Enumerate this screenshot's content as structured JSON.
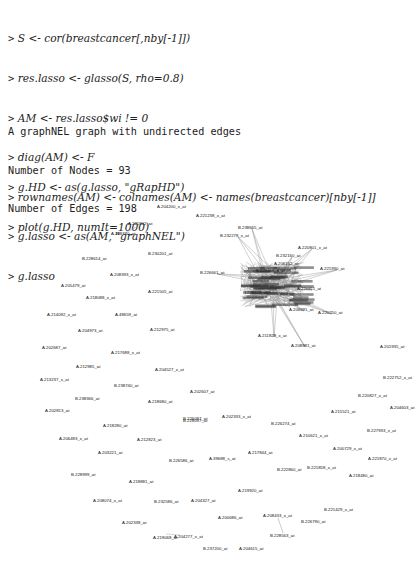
{
  "code": {
    "lines": [
      {
        "prompt": ">",
        "text": "S <- cor(breastcancer[,nby[-1]])"
      },
      {
        "prompt": ">",
        "text": "res.lasso <- glasso(S, rho=0.8)"
      },
      {
        "prompt": ">",
        "text": "AM <- res.lasso$wi != 0"
      },
      {
        "prompt": ">",
        "text": "diag(AM) <- F"
      },
      {
        "prompt": ">",
        "text": "rownames(AM) <- colnames(AM) <- names(breastcancer)[nby[-1]]"
      },
      {
        "prompt": ">",
        "text": "g.lasso <- as(AM, \"graphNEL\")"
      },
      {
        "prompt": ">",
        "text": "g.lasso"
      }
    ]
  },
  "output": {
    "lines": [
      "A graphNEL graph with undirected edges",
      "Number of Nodes = 93",
      "Number of Edges = 198"
    ]
  },
  "code2": {
    "lines": [
      {
        "prompt": ">",
        "text": "g.HD <- as(g.lasso, \"gRapHD\")"
      },
      {
        "prompt": ">",
        "text": "plot(g.HD, numIt=1000)"
      }
    ]
  },
  "plot": {
    "description": "gRapHD network plot of lasso graph",
    "nodes": 93,
    "edges": 198,
    "edge_color": "#9a9a9a",
    "label_color": "#111111",
    "labels": [
      {
        "text": "A.204200_x_at",
        "x": 157,
        "y": 22
      },
      {
        "text": "A.221238_x_at",
        "x": 196,
        "y": 31
      },
      {
        "text": "A.221802_at",
        "x": 128,
        "y": 39
      },
      {
        "text": "A.208340_at",
        "x": 111,
        "y": 49
      },
      {
        "text": "B.238665_at",
        "x": 238,
        "y": 43
      },
      {
        "text": "B.232278_x_at",
        "x": 220,
        "y": 51
      },
      {
        "text": "B.230201_at",
        "x": 148,
        "y": 69
      },
      {
        "text": "B.228614_at",
        "x": 82,
        "y": 74
      },
      {
        "text": "A.208393_x_at",
        "x": 110,
        "y": 90
      },
      {
        "text": "B.226661_at",
        "x": 200,
        "y": 88
      },
      {
        "text": "A.205479_at",
        "x": 61,
        "y": 101
      },
      {
        "text": "A.221505_at",
        "x": 148,
        "y": 107
      },
      {
        "text": "A.218088_x_at",
        "x": 86,
        "y": 113
      },
      {
        "text": "A.220801_x_at",
        "x": 298,
        "y": 63
      },
      {
        "text": "B.232160_at",
        "x": 276,
        "y": 71
      },
      {
        "text": "A.206162_at",
        "x": 274,
        "y": 79
      },
      {
        "text": "B.229858_x_at",
        "x": 256,
        "y": 86
      },
      {
        "text": "A.221930_at",
        "x": 320,
        "y": 84
      },
      {
        "text": "A.220811_at",
        "x": 297,
        "y": 104
      },
      {
        "text": "A.214092_x_at",
        "x": 47,
        "y": 130
      },
      {
        "text": "A.48659_at",
        "x": 115,
        "y": 130
      },
      {
        "text": "B.228510_at",
        "x": 243,
        "y": 108
      },
      {
        "text": "A.220250_at",
        "x": 318,
        "y": 128
      },
      {
        "text": "A.206691_at",
        "x": 289,
        "y": 125
      },
      {
        "text": "A.204973_at",
        "x": 78,
        "y": 146
      },
      {
        "text": "A.212975_at",
        "x": 150,
        "y": 145
      },
      {
        "text": "A.211828_x_at",
        "x": 258,
        "y": 151
      },
      {
        "text": "A.202687_at",
        "x": 42,
        "y": 163
      },
      {
        "text": "A.217688_x_at",
        "x": 111,
        "y": 168
      },
      {
        "text": "A.208981_at",
        "x": 291,
        "y": 161
      },
      {
        "text": "A.201935_at",
        "x": 380,
        "y": 162
      },
      {
        "text": "A.212985_at",
        "x": 76,
        "y": 182
      },
      {
        "text": "A.204527_x_at",
        "x": 155,
        "y": 185
      },
      {
        "text": "A.213237_x_at",
        "x": 40,
        "y": 195
      },
      {
        "text": "B.222752_x_at",
        "x": 383,
        "y": 193
      },
      {
        "text": "B.238740_at",
        "x": 114,
        "y": 201
      },
      {
        "text": "A.202607_at",
        "x": 190,
        "y": 207
      },
      {
        "text": "B.238366_at",
        "x": 75,
        "y": 214
      },
      {
        "text": "A.218680_at",
        "x": 148,
        "y": 217
      },
      {
        "text": "B.220827_x_at",
        "x": 358,
        "y": 211
      },
      {
        "text": "A.202813_at",
        "x": 45,
        "y": 226
      },
      {
        "text": "A.215521_at",
        "x": 331,
        "y": 227
      },
      {
        "text": "A.204603_at",
        "x": 390,
        "y": 223
      },
      {
        "text": "B.226087_at",
        "x": 183,
        "y": 234
      },
      {
        "text": "A.202333_x_at",
        "x": 222,
        "y": 232
      },
      {
        "text": "A.218280_at",
        "x": 103,
        "y": 241
      },
      {
        "text": "B.226274_at",
        "x": 271,
        "y": 239
      },
      {
        "text": "A.210621_x_at",
        "x": 299,
        "y": 251
      },
      {
        "text": "B.227933_x_at",
        "x": 367,
        "y": 246
      },
      {
        "text": "A.206483_x_at",
        "x": 59,
        "y": 254
      },
      {
        "text": "A.212823_at",
        "x": 137,
        "y": 255
      },
      {
        "text": "B.228097_at",
        "x": 183,
        "y": 236
      },
      {
        "text": "A.203221_at",
        "x": 98,
        "y": 268
      },
      {
        "text": "A.217844_at",
        "x": 248,
        "y": 268
      },
      {
        "text": "A.200729_x_at",
        "x": 333,
        "y": 264
      },
      {
        "text": "A.221870_x_at",
        "x": 368,
        "y": 274
      },
      {
        "text": "B.226586_at",
        "x": 169,
        "y": 276
      },
      {
        "text": "A.39688_s_at",
        "x": 209,
        "y": 274
      },
      {
        "text": "B.228999_at",
        "x": 71,
        "y": 290
      },
      {
        "text": "B.222860_at",
        "x": 277,
        "y": 285
      },
      {
        "text": "B.221858_x_at",
        "x": 307,
        "y": 283
      },
      {
        "text": "A.218881_at",
        "x": 129,
        "y": 297
      },
      {
        "text": "A.218480_at",
        "x": 349,
        "y": 291
      },
      {
        "text": "A.219920_at",
        "x": 238,
        "y": 306
      },
      {
        "text": "A.208074_x_at",
        "x": 93,
        "y": 316
      },
      {
        "text": "B.232586_at",
        "x": 154,
        "y": 317
      },
      {
        "text": "A.204327_at",
        "x": 191,
        "y": 316
      },
      {
        "text": "B.221429_x_at",
        "x": 324,
        "y": 325
      },
      {
        "text": "A.202338_at",
        "x": 122,
        "y": 338
      },
      {
        "text": "A.208433_x_at",
        "x": 263,
        "y": 331
      },
      {
        "text": "A.200686_at",
        "x": 218,
        "y": 333
      },
      {
        "text": "B.226790_at",
        "x": 301,
        "y": 337
      },
      {
        "text": "A.219068_at",
        "x": 153,
        "y": 353
      },
      {
        "text": "A.204277_x_at",
        "x": 174,
        "y": 352
      },
      {
        "text": "B.228563_at",
        "x": 270,
        "y": 351
      },
      {
        "text": "B.237200_at",
        "x": 203,
        "y": 364
      },
      {
        "text": "A.204615_at",
        "x": 239,
        "y": 364
      }
    ]
  }
}
